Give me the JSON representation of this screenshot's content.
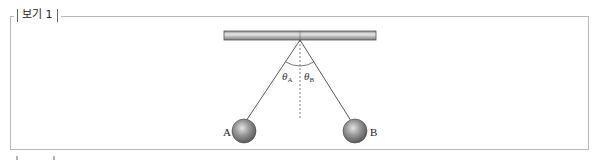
{
  "box": {
    "label": "보기 1"
  },
  "diagram": {
    "ball_a_label": "A",
    "ball_b_label": "B",
    "angle_a_label": "θ",
    "angle_a_sub": "A",
    "angle_b_label": "θ",
    "angle_b_sub": "B"
  }
}
